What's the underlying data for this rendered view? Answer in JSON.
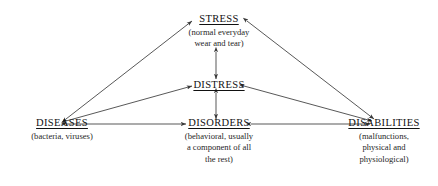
{
  "diagram": {
    "line_color": "#3a3a3a",
    "text_color": "#1a1a1a",
    "background_color": "#ffffff",
    "nodes": [
      {
        "id": "stress",
        "label": "STRESS",
        "sub_lines": [
          "(normal everyday",
          "wear and tear)"
        ],
        "position": "top-center"
      },
      {
        "id": "distress",
        "label": "DISTRESS",
        "sub_lines": [],
        "position": "middle-center"
      },
      {
        "id": "diseases",
        "label": "DISEASES",
        "sub_lines": [
          "(bacteria, viruses)"
        ],
        "position": "bottom-left"
      },
      {
        "id": "disorders",
        "label": "DISORDERS",
        "sub_lines": [
          "(behavioral, usually",
          "a component of all",
          "the rest)"
        ],
        "position": "bottom-center"
      },
      {
        "id": "disabilities",
        "label": "DISABILITIES",
        "sub_lines": [
          "(malfunctions,",
          "physical and",
          "physiological)"
        ],
        "position": "bottom-right"
      }
    ],
    "edges": [
      {
        "id": "diseases-stress",
        "from": "diseases",
        "to": "stress",
        "arrows": "both"
      },
      {
        "id": "stress-disabilities",
        "from": "stress",
        "to": "disabilities",
        "arrows": "both"
      },
      {
        "id": "stress-distress",
        "from": "stress",
        "to": "distress",
        "arrows": "both"
      },
      {
        "id": "distress-disorders",
        "from": "distress",
        "to": "disorders",
        "arrows": "both"
      },
      {
        "id": "diseases-distress",
        "from": "diseases",
        "to": "distress",
        "arrows": "both"
      },
      {
        "id": "distress-disabilities",
        "from": "distress",
        "to": "disabilities",
        "arrows": "both"
      },
      {
        "id": "diseases-disorders",
        "from": "diseases",
        "to": "disorders",
        "arrows": "both"
      },
      {
        "id": "disorders-disabilities",
        "from": "disorders",
        "to": "disabilities",
        "arrows": "both"
      }
    ]
  }
}
